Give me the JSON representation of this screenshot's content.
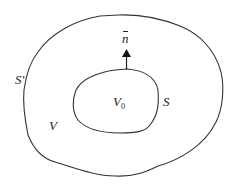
{
  "diagram": {
    "type": "nested closed surfaces",
    "outer_surface": {
      "label": "S'",
      "region_label": "V"
    },
    "inner_surface": {
      "label": "S",
      "region_label_main": "V",
      "region_label_sub": "0"
    },
    "normal_vector": {
      "label": "n"
    },
    "colors": {
      "stroke": "#333333",
      "background": "#ffffff"
    }
  }
}
